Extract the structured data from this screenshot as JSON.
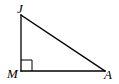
{
  "diagram": {
    "type": "right-triangle",
    "vertices": {
      "J": {
        "label": "J",
        "x": 21,
        "y": 15
      },
      "M": {
        "label": "M",
        "x": 21,
        "y": 71
      },
      "A": {
        "label": "A",
        "x": 105,
        "y": 71
      }
    },
    "right_angle_at": "M",
    "right_angle_marker_size": 11,
    "stroke_color": "#000000",
    "background_color": "#ffffff"
  }
}
